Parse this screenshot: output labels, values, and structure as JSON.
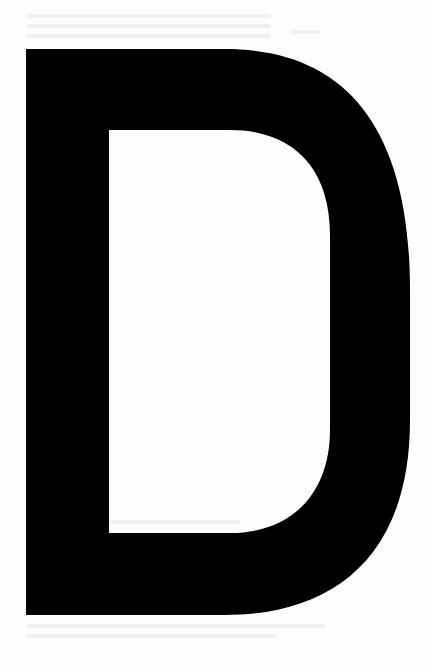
{
  "page": {
    "background_color": "#fdfdfd",
    "glyph": {
      "character": "D",
      "color": "#000000",
      "bbox": {
        "left": 26,
        "top": 49,
        "right": 410,
        "bottom": 615
      },
      "counter_bbox": {
        "left": 109,
        "top": 130,
        "right": 330,
        "bottom": 533
      }
    },
    "show_through_text": "illegible"
  }
}
